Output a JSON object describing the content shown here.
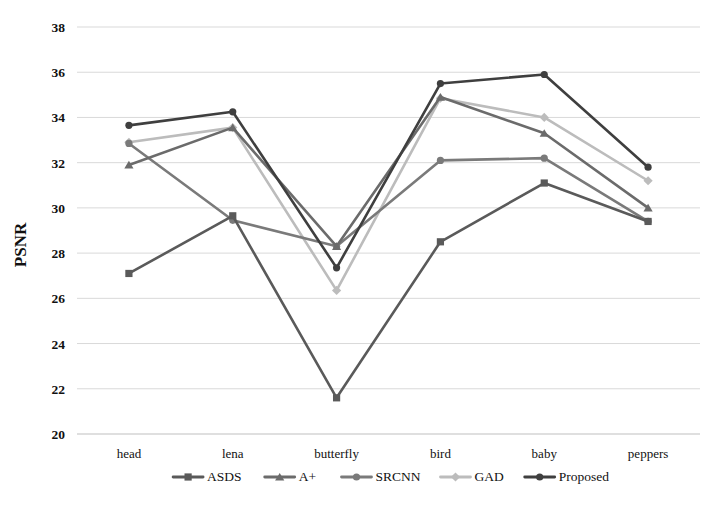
{
  "chart_data": {
    "type": "line",
    "title": "",
    "xlabel": "",
    "ylabel": "PSNR",
    "categories": [
      "head",
      "lena",
      "butterfly",
      "bird",
      "baby",
      "peppers"
    ],
    "ylim": [
      20,
      38
    ],
    "yticks": [
      20,
      22,
      24,
      26,
      28,
      30,
      32,
      34,
      36,
      38
    ],
    "ytick_labels": [
      "20",
      "22",
      "24",
      "26",
      "28",
      "30",
      "32",
      "34",
      "36",
      "38"
    ],
    "grid": true,
    "legend_position": "bottom",
    "series": [
      {
        "name": "ASDS",
        "marker": "square",
        "color": "#5a5a5a",
        "values": [
          27.1,
          29.65,
          21.6,
          28.5,
          31.1,
          29.4
        ]
      },
      {
        "name": "A+",
        "marker": "triangle",
        "color": "#6b6b6b",
        "values": [
          31.9,
          33.55,
          28.3,
          34.9,
          33.3,
          30.0
        ]
      },
      {
        "name": "SRCNN",
        "marker": "circle",
        "color": "#7a7a7a",
        "values": [
          32.85,
          29.45,
          28.3,
          32.1,
          32.2,
          29.4
        ]
      },
      {
        "name": "GAD",
        "marker": "diamond",
        "color": "#bcbcbc",
        "values": [
          32.9,
          33.55,
          26.35,
          34.85,
          34.0,
          31.2
        ]
      },
      {
        "name": "Proposed",
        "marker": "circle",
        "color": "#3f3f3f",
        "values": [
          33.65,
          34.25,
          27.35,
          35.5,
          35.9,
          31.8
        ]
      }
    ]
  }
}
